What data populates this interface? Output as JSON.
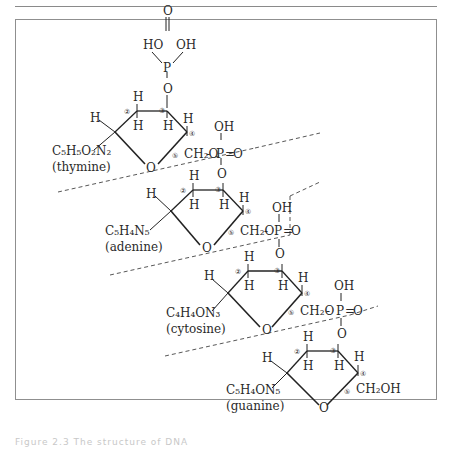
{
  "figure": {
    "caption_partial": "Figure 2.3  The structure of DNA",
    "top_phosphate": {
      "left_oh": "HO",
      "right_oh": "OH",
      "double_o": "O",
      "p": "P",
      "o_link": "O"
    },
    "units": [
      {
        "base_formula": "C₅H₅O₂N₂",
        "base_name": "(thymine)",
        "h_top_c2": "H",
        "h_bot_c2": "H",
        "h_c1": "H",
        "h_bot_c3": "H",
        "h_c4": "H",
        "ring_o": "O",
        "c5_group": "CH₂O",
        "phosphate": {
          "oh": "OH",
          "p": "P",
          "eq_o": "O",
          "link_o": "O"
        }
      },
      {
        "base_formula": "C₅H₄N₅",
        "base_name": "(adenine)",
        "h_top_c2": "H",
        "h_bot_c2": "H",
        "h_c1": "H",
        "h_bot_c3": "H",
        "h_c4": "H",
        "ring_o": "O",
        "c5_group": "CH₂O",
        "phosphate": {
          "oh": "OH",
          "p": "P",
          "eq_o": "O",
          "link_o": "O"
        }
      },
      {
        "base_formula": "C₄H₄ON₃",
        "base_name": "(cytosine)",
        "h_top_c2": "H",
        "h_bot_c2": "H",
        "h_c1": "H",
        "h_bot_c3": "H",
        "h_c4": "H",
        "ring_o": "O",
        "c5_group": "CH₂O",
        "phosphate": {
          "oh": "OH",
          "p": "P",
          "eq_o": "O",
          "link_o": "O"
        }
      },
      {
        "base_formula": "C₅H₄ON₅",
        "base_name": "(guanine)",
        "h_top_c2": "H",
        "h_bot_c2": "H",
        "h_c1": "H",
        "h_bot_c3": "H",
        "h_c4": "H",
        "ring_o": "O",
        "c5_group": "CH₂OH"
      }
    ],
    "carbon_numbers": [
      "②",
      "③",
      "④",
      "⑤"
    ]
  }
}
